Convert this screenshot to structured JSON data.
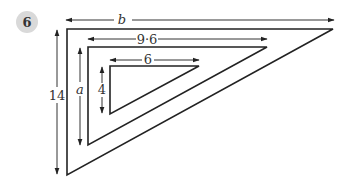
{
  "question": {
    "number": "6",
    "badge_color": "#d9d9d9"
  },
  "diagram": {
    "line_color": "#222222",
    "triangles": [
      {
        "name": "outer",
        "height_label": "14",
        "base_label": "b"
      },
      {
        "name": "middle",
        "height_label": "a",
        "base_label": "9·6"
      },
      {
        "name": "inner",
        "height_label": "4",
        "base_label": "6"
      }
    ]
  }
}
